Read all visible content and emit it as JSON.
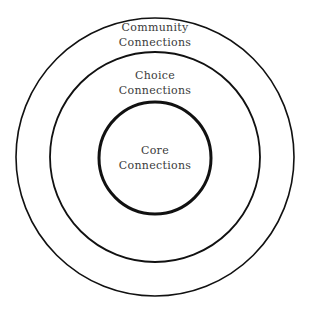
{
  "diagram": {
    "type": "concentric-circles",
    "colors": {
      "stroke": "#111111",
      "text": "#3a3a3a",
      "background": "#ffffff"
    },
    "circles": [
      {
        "id": "community",
        "line1": "Community",
        "line2": "Connections",
        "cx": 155,
        "cy": 157,
        "r": 139,
        "stroke_width": 1.6
      },
      {
        "id": "choice",
        "line1": "Choice",
        "line2": "Connections",
        "cx": 155,
        "cy": 157,
        "r": 105,
        "stroke_width": 1.8
      },
      {
        "id": "core",
        "line1": "Core",
        "line2": "Connections",
        "cx": 155,
        "cy": 158,
        "r": 56,
        "stroke_width": 3
      }
    ]
  }
}
